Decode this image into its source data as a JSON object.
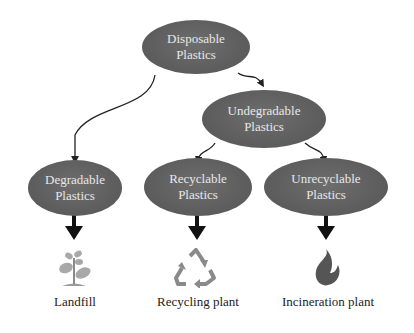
{
  "diagram": {
    "nodes": [
      {
        "id": "disposable",
        "line1": "Disposable",
        "line2": "Plastics"
      },
      {
        "id": "undegradable",
        "line1": "Undegradable",
        "line2": "Plastics"
      },
      {
        "id": "degradable",
        "line1": "Degradable",
        "line2": "Plastics"
      },
      {
        "id": "recyclable",
        "line1": "Recyclable",
        "line2": "Plastics"
      },
      {
        "id": "unrecyclable",
        "line1": "Unrecyclable",
        "line2": "Plastics"
      }
    ],
    "outcomes": [
      {
        "id": "landfill",
        "label": "Landfill",
        "icon": "plant-sprout-icon"
      },
      {
        "id": "recycling",
        "label": "Recycling plant",
        "icon": "recycle-icon"
      },
      {
        "id": "incineration",
        "label": "Incineration plant",
        "icon": "flame-icon"
      }
    ],
    "edges": [
      {
        "from": "disposable",
        "to": "degradable"
      },
      {
        "from": "disposable",
        "to": "undegradable"
      },
      {
        "from": "undegradable",
        "to": "recyclable"
      },
      {
        "from": "undegradable",
        "to": "unrecyclable"
      },
      {
        "from": "degradable",
        "to": "landfill"
      },
      {
        "from": "recyclable",
        "to": "recycling"
      },
      {
        "from": "unrecyclable",
        "to": "incineration"
      }
    ],
    "colors": {
      "node_fill": "#5e5e5e",
      "node_text": "#e8e8e8",
      "icon_fill": "#8a8a8a",
      "line": "#222222"
    }
  }
}
